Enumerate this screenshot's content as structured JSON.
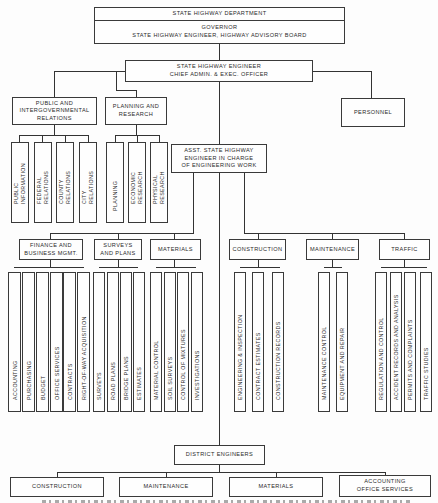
{
  "chart": {
    "top": {
      "department": "STATE HIGHWAY DEPARTMENT",
      "governance": "GOVERNOR\nSTATE HIGHWAY ENGINEER, HIGHWAY ADVISORY BOARD"
    },
    "chief": "STATE HIGHWAY ENGINEER\nCHIEF ADMIN. & EXEC. OFFICER",
    "public_relations": {
      "title": "PUBLIC AND\nINTERGOVERNMENTAL\nRELATIONS",
      "units": [
        "PUBLIC\nINFORMATION",
        "FEDERAL\nRELATIONS",
        "COUNTY\nRELATIONS",
        "CITY\nRELATIONS"
      ]
    },
    "planning": {
      "title": "PLANNING AND\nRESEARCH",
      "units": [
        "PLANNING",
        "ECONOMIC\nRESEARCH",
        "PHYSICAL\nRESEARCH"
      ]
    },
    "personnel": "PERSONNEL",
    "asst_engineer": "ASST. STATE HIGHWAY\nENGINEER IN CHARGE\nOF ENGINEERING WORK",
    "finance": {
      "title": "FINANCE AND\nBUSINESS MGMT.",
      "units": [
        "ACCOUNTING",
        "PURCHASING",
        "BUDGET",
        "OFFICE SERVICES",
        "CONTRACTS",
        "RIGHT-OF-WAY ACQUISITION"
      ]
    },
    "surveys": {
      "title": "SURVEYS\nAND PLANS",
      "units": [
        "SURVEYS",
        "ROAD PLANS",
        "BRIDGE PLANS",
        "ESTIMATES"
      ]
    },
    "materials": {
      "title": "MATERIALS",
      "units": [
        "MATERIAL CONTROL",
        "SOIL SURVEYS",
        "CONTROL OF MIXTURES",
        "INVESTIGATIONS"
      ]
    },
    "construction": {
      "title": "CONSTRUCTION",
      "units": [
        "ENGINEERING & INSPECTION",
        "CONTRACT ESTIMATES",
        "CONSTRUCTION RECORDS"
      ]
    },
    "maintenance": {
      "title": "MAINTENANCE",
      "units": [
        "MAINTENANCE CONTROL",
        "EQUIPMENT AND REPAIR"
      ]
    },
    "traffic": {
      "title": "TRAFFIC",
      "units": [
        "REGULATION AND CONTROL",
        "ACCIDENT RECORDS AND ANALYSIS",
        "PERMITS AND COMPLAINTS",
        "TRAFFIC STUDIES"
      ]
    },
    "district": {
      "title": "DISTRICT ENGINEERS",
      "units": [
        "CONSTRUCTION",
        "MAINTENANCE",
        "MATERIALS",
        "ACCOUNTING\nOFFICE SERVICES"
      ]
    }
  }
}
